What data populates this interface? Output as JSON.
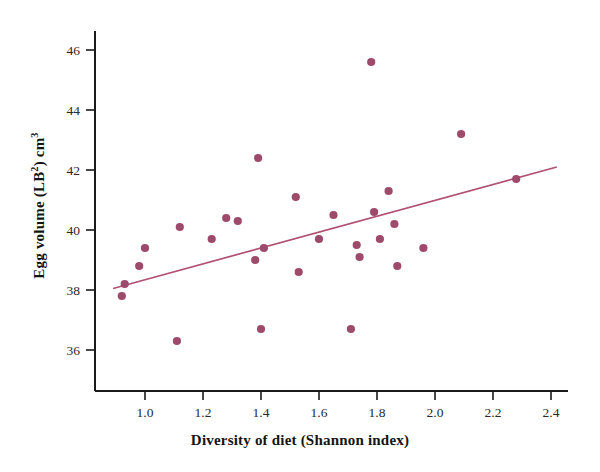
{
  "figure": {
    "background_color": "#ffffff",
    "axis_color": "#1a1a1a",
    "marker_color": "#9d4a6b",
    "line_color": "#b0516f"
  },
  "axes": {
    "x_title": "Diversity of diet (Shannon index)",
    "y_title_parts": {
      "prefix": "Egg volume (LB",
      "sup1": "2",
      "middle": ") cm",
      "sup2": "3"
    },
    "y_title_plain": "Egg volume (LB2) cm3",
    "x_ticks": [
      "1.0",
      "1.2",
      "1.4",
      "1.6",
      "1.8",
      "2.0",
      "2.2",
      "2.4"
    ],
    "y_ticks": [
      "36",
      "38",
      "40",
      "42",
      "44",
      "46"
    ]
  },
  "chart_data": {
    "type": "scatter",
    "title": "",
    "xlabel": "Diversity of diet (Shannon index)",
    "ylabel": "Egg volume (LB2) cm3",
    "xlim": [
      0.87,
      2.45
    ],
    "ylim": [
      34.9,
      46.9
    ],
    "xticks": [
      1.0,
      1.2,
      1.4,
      1.6,
      1.8,
      2.0,
      2.2,
      2.4
    ],
    "yticks": [
      36,
      38,
      40,
      42,
      44,
      46
    ],
    "grid": false,
    "legend": null,
    "points": [
      {
        "x": 0.92,
        "y": 37.8
      },
      {
        "x": 0.93,
        "y": 38.2
      },
      {
        "x": 0.98,
        "y": 38.8
      },
      {
        "x": 1.0,
        "y": 39.4
      },
      {
        "x": 1.11,
        "y": 36.3
      },
      {
        "x": 1.12,
        "y": 40.1
      },
      {
        "x": 1.23,
        "y": 39.7
      },
      {
        "x": 1.28,
        "y": 40.4
      },
      {
        "x": 1.32,
        "y": 40.3
      },
      {
        "x": 1.38,
        "y": 39.0
      },
      {
        "x": 1.39,
        "y": 42.4
      },
      {
        "x": 1.4,
        "y": 36.7
      },
      {
        "x": 1.41,
        "y": 39.4
      },
      {
        "x": 1.52,
        "y": 41.1
      },
      {
        "x": 1.53,
        "y": 38.6
      },
      {
        "x": 1.6,
        "y": 39.7
      },
      {
        "x": 1.65,
        "y": 40.5
      },
      {
        "x": 1.71,
        "y": 36.7
      },
      {
        "x": 1.73,
        "y": 39.5
      },
      {
        "x": 1.74,
        "y": 39.1
      },
      {
        "x": 1.78,
        "y": 45.6
      },
      {
        "x": 1.79,
        "y": 40.6
      },
      {
        "x": 1.81,
        "y": 39.7
      },
      {
        "x": 1.84,
        "y": 41.3
      },
      {
        "x": 1.86,
        "y": 40.2
      },
      {
        "x": 1.87,
        "y": 38.8
      },
      {
        "x": 1.96,
        "y": 39.4
      },
      {
        "x": 2.09,
        "y": 43.2
      },
      {
        "x": 2.28,
        "y": 41.7
      }
    ],
    "trend_line": {
      "type": "linear",
      "x_start": 0.89,
      "y_start": 38.05,
      "x_end": 2.42,
      "y_end": 42.1
    }
  }
}
